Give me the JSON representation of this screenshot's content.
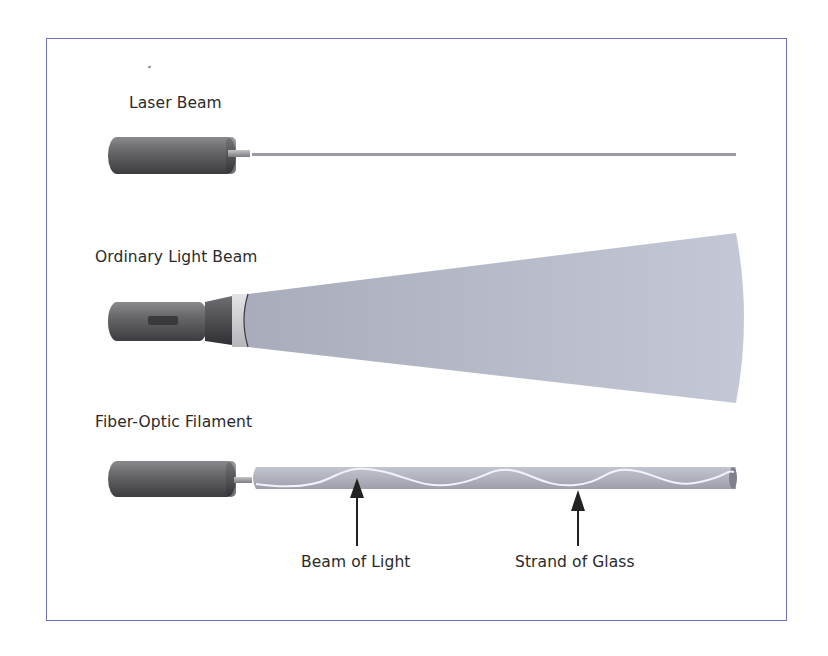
{
  "diagram": {
    "sections": [
      {
        "id": "laser",
        "title": "Laser Beam"
      },
      {
        "id": "ordinary",
        "title": "Ordinary Light Beam"
      },
      {
        "id": "fiber",
        "title": "Fiber-Optic Filament"
      }
    ],
    "annotations": [
      {
        "label": "Beam of Light",
        "points_to": "wave inside strand"
      },
      {
        "label": "Strand of Glass",
        "points_to": "glass strand"
      }
    ],
    "colors": {
      "frame": "#6f70b8",
      "emitter_body": "#5a5a5e",
      "beam_fill": "#b9bccb",
      "strand_fill": "#aeb0bc",
      "wave": "#f2f3f8",
      "text": "#2a2a2a"
    }
  }
}
